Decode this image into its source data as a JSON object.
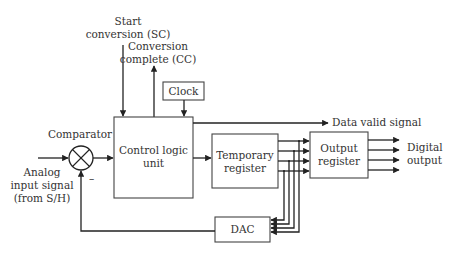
{
  "diagram": {
    "blocks": {
      "control_logic": {
        "line1": "Control logic",
        "line2": "unit"
      },
      "clock": {
        "label": "Clock"
      },
      "temporary_register": {
        "line1": "Temporary",
        "line2": "register"
      },
      "output_register": {
        "line1": "Output",
        "line2": "register"
      },
      "dac": {
        "label": "DAC"
      },
      "comparator": {
        "label": "Comparator",
        "minus_sign": "–"
      }
    },
    "signals": {
      "start_conversion": {
        "line1": "Start",
        "line2": "conversion (SC)"
      },
      "conversion_complete": {
        "line1": "Conversion",
        "line2": "complete (CC)"
      },
      "data_valid": {
        "label": "Data valid signal"
      },
      "analog_input": {
        "line1": "Analog",
        "line2": "input signal",
        "line3": "(from S/H)"
      },
      "digital_output": {
        "line1": "Digital",
        "line2": "output"
      }
    },
    "colors": {
      "line": "#222222",
      "box_border": "#444444",
      "text": "#333333",
      "background": "#ffffff"
    }
  }
}
